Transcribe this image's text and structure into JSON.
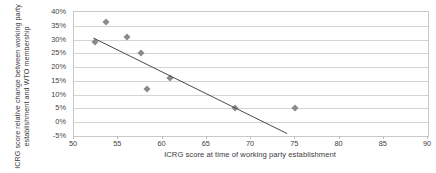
{
  "chart_data": {
    "type": "scatter",
    "title": "",
    "xlabel": "ICRG score at time of working party establishment",
    "ylabel": "ICRG score relative change between working party establishment and WTO membership",
    "xlim": [
      50,
      90
    ],
    "ylim": [
      -0.05,
      0.4
    ],
    "grid": true,
    "legend": false,
    "xticks": [
      50,
      55,
      60,
      65,
      70,
      75,
      80,
      85,
      90
    ],
    "xtick_labels": [
      "50",
      "55",
      "60",
      "65",
      "70",
      "75",
      "80",
      "85",
      "90"
    ],
    "yticks": [
      -0.05,
      0.0,
      0.05,
      0.1,
      0.15,
      0.2,
      0.25,
      0.3,
      0.35,
      0.4
    ],
    "ytick_labels": [
      "-5%",
      "0%",
      "5%",
      "10%",
      "15%",
      "20%",
      "25%",
      "30%",
      "35%",
      "40%"
    ],
    "series": [
      {
        "name": "countries",
        "marker": "diamond",
        "color": "#8a8a8a",
        "points": [
          {
            "x": 52.4,
            "y": 0.29
          },
          {
            "x": 53.6,
            "y": 0.365
          },
          {
            "x": 56.0,
            "y": 0.31
          },
          {
            "x": 57.6,
            "y": 0.25
          },
          {
            "x": 58.2,
            "y": 0.12
          },
          {
            "x": 60.9,
            "y": 0.16
          },
          {
            "x": 68.2,
            "y": 0.05
          },
          {
            "x": 75.0,
            "y": 0.05
          }
        ]
      }
    ],
    "trendline": {
      "name": "linear-fit",
      "color": "#4a4a4a",
      "x_start": 52.3,
      "y_start": 0.302,
      "x_end": 74.2,
      "y_end": -0.045
    }
  },
  "axes": {
    "x_title": "ICRG score at time of working party establishment",
    "y_title": "ICRG score relative change between working party establishment and WTO membership"
  }
}
